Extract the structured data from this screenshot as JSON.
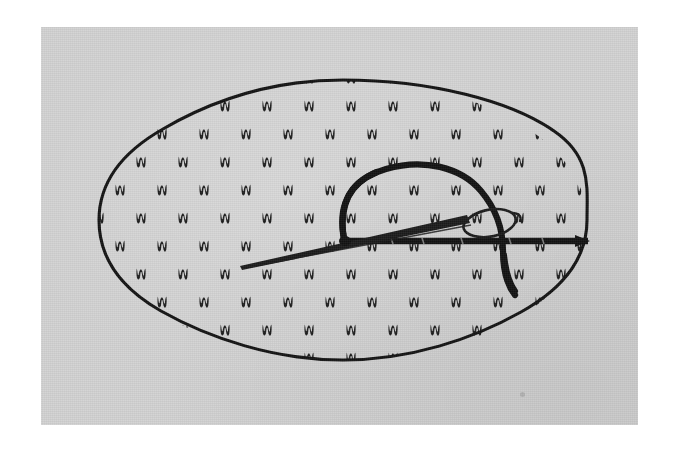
{
  "figure": {
    "kind": "line-drawing-photograph",
    "alt_text": "Black and white line illustration of an oval piece of patterned fabric with a threaded sewing needle forming a loop stitch across its middle",
    "colors": {
      "page_background": "#ffffff",
      "photo_background": "#d2d2d2",
      "ink": "#1a1a1a",
      "speck": "#a8a8a8"
    },
    "photo_frame": {
      "x": 41,
      "y": 27,
      "width": 597,
      "height": 398,
      "border_label": "white photographic margin"
    },
    "oval": {
      "center_x": 343,
      "center_y": 220,
      "radius_x": 247,
      "radius_y": 143,
      "stroke_width": 3,
      "label": "fabric oval outline"
    },
    "pattern": {
      "motif_name": "double-tick-motif",
      "motif_glyph": "ᴍ",
      "description": "staggered grid of small double vertical tick marks",
      "columns": 13,
      "rows": 11,
      "spacing_x": 42,
      "spacing_y": 28,
      "stagger_offset_x": 21,
      "motif_width": 9,
      "motif_height": 11
    },
    "needle": {
      "label": "sewing needle",
      "point_x": 240,
      "point_y": 266,
      "eye_x": 472,
      "eye_y": 214,
      "eye_length": 46,
      "eye_width": 13,
      "stroke_width": 2
    },
    "thread": {
      "label": "embroidery thread",
      "stroke_width": 6,
      "loop_label": "thread loop arc",
      "running_line_label": "horizontal running stitch thread",
      "running_line_start_x": 348,
      "running_line_end_x": 588,
      "running_line_y": 241,
      "tail_label": "thread tail",
      "tail_end_x": 515,
      "tail_end_y": 294
    },
    "speck": {
      "x": 522,
      "y": 394,
      "label": "dust speck on photograph"
    }
  },
  "annotations": {
    "visible_text": [],
    "note": "No text or labels appear anywhere in the image."
  }
}
